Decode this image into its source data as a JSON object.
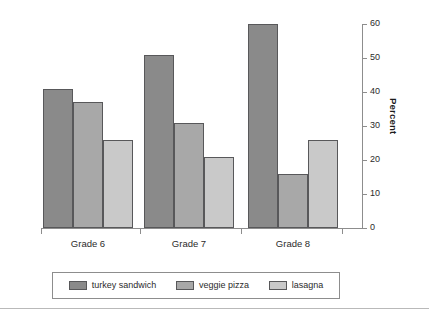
{
  "chart_data": {
    "type": "bar",
    "title": "",
    "xlabel": "",
    "ylabel": "Percent",
    "ylim": [
      0,
      60
    ],
    "yticks": [
      0,
      10,
      20,
      30,
      40,
      50,
      60
    ],
    "ytick_labels": [
      "0",
      "10",
      "20",
      "30",
      "40",
      "50",
      "60"
    ],
    "y_axis_position": "right",
    "grid": false,
    "legend_position": "bottom",
    "categories": [
      "Grade 6",
      "Grade 7",
      "Grade 8"
    ],
    "series": [
      {
        "name": "turkey sandwich",
        "color": "#8a8a8a",
        "values": [
          41,
          51,
          60
        ]
      },
      {
        "name": "veggie pizza",
        "color": "#a8a8a8",
        "values": [
          37,
          31,
          16
        ]
      },
      {
        "name": "lasagna",
        "color": "#c9c9c9",
        "values": [
          26,
          21,
          26
        ]
      }
    ]
  },
  "axis": {
    "title": "Percent"
  },
  "legend": {
    "items": [
      {
        "label": "turkey sandwich",
        "color": "#8a8a8a"
      },
      {
        "label": "veggie pizza",
        "color": "#a8a8a8"
      },
      {
        "label": "lasagna",
        "color": "#c9c9c9"
      }
    ]
  }
}
